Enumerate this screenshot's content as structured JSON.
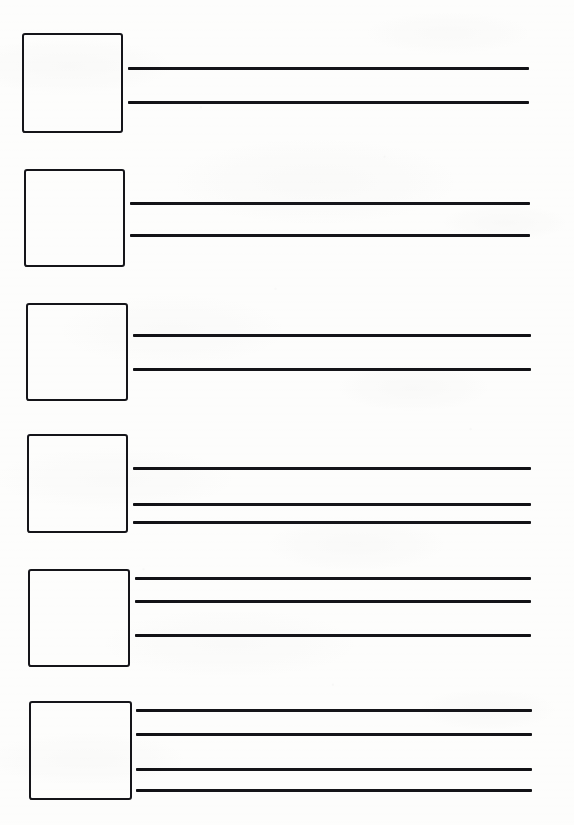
{
  "document": {
    "kind": "scanned-blank-worksheet",
    "page_width": 574,
    "page_height": 825,
    "paper_color": "#fdfdfc",
    "ink_color": "#15151a",
    "row_count": 6,
    "total_rule_line_count": 16,
    "visible_text": "",
    "notes": "No printed text, labels, numbers or headings are visible on the page."
  },
  "rows": [
    {
      "index": 1,
      "name": "worksheet-row-1",
      "box": {
        "x": 22,
        "y": 33,
        "width": 101,
        "height": 100,
        "value": "",
        "placeholder": ""
      },
      "line_count": 2,
      "lines": [
        {
          "index": 1,
          "x": 128,
          "y": 67,
          "width": 401,
          "value": ""
        },
        {
          "index": 2,
          "x": 128,
          "y": 101,
          "width": 401,
          "value": ""
        }
      ]
    },
    {
      "index": 2,
      "name": "worksheet-row-2",
      "box": {
        "x": 24,
        "y": 169,
        "width": 101,
        "height": 98,
        "value": "",
        "placeholder": ""
      },
      "line_count": 2,
      "lines": [
        {
          "index": 1,
          "x": 130,
          "y": 202,
          "width": 400,
          "value": ""
        },
        {
          "index": 2,
          "x": 130,
          "y": 234,
          "width": 400,
          "value": ""
        }
      ]
    },
    {
      "index": 3,
      "name": "worksheet-row-3",
      "box": {
        "x": 26,
        "y": 303,
        "width": 102,
        "height": 98,
        "value": "",
        "placeholder": ""
      },
      "line_count": 2,
      "lines": [
        {
          "index": 1,
          "x": 133,
          "y": 334,
          "width": 398,
          "value": ""
        },
        {
          "index": 2,
          "x": 133,
          "y": 368,
          "width": 398,
          "value": ""
        }
      ]
    },
    {
      "index": 4,
      "name": "worksheet-row-4",
      "box": {
        "x": 27,
        "y": 434,
        "width": 101,
        "height": 99,
        "value": "",
        "placeholder": ""
      },
      "line_count": 3,
      "lines": [
        {
          "index": 1,
          "x": 133,
          "y": 467,
          "width": 398,
          "value": ""
        },
        {
          "index": 2,
          "x": 133,
          "y": 503,
          "width": 398,
          "value": ""
        },
        {
          "index": 3,
          "x": 133,
          "y": 521,
          "width": 398,
          "value": ""
        }
      ]
    },
    {
      "index": 5,
      "name": "worksheet-row-5",
      "box": {
        "x": 28,
        "y": 569,
        "width": 102,
        "height": 98,
        "value": "",
        "placeholder": ""
      },
      "line_count": 3,
      "lines": [
        {
          "index": 1,
          "x": 135,
          "y": 577,
          "width": 396,
          "value": ""
        },
        {
          "index": 2,
          "x": 135,
          "y": 600,
          "width": 396,
          "value": ""
        },
        {
          "index": 3,
          "x": 135,
          "y": 634,
          "width": 396,
          "value": ""
        }
      ]
    },
    {
      "index": 6,
      "name": "worksheet-row-6",
      "box": {
        "x": 29,
        "y": 701,
        "width": 103,
        "height": 99,
        "value": "",
        "placeholder": ""
      },
      "line_count": 4,
      "lines": [
        {
          "index": 1,
          "x": 136,
          "y": 709,
          "width": 396,
          "value": ""
        },
        {
          "index": 2,
          "x": 136,
          "y": 733,
          "width": 396,
          "value": ""
        },
        {
          "index": 3,
          "x": 136,
          "y": 768,
          "width": 396,
          "value": ""
        },
        {
          "index": 4,
          "x": 136,
          "y": 789,
          "width": 396,
          "value": ""
        }
      ]
    }
  ]
}
